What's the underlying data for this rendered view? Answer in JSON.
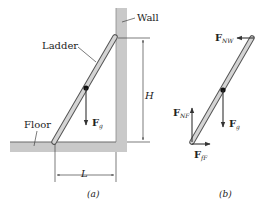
{
  "figure": {
    "panel_a": {
      "caption": "(a)",
      "labels": {
        "wall": "Wall",
        "ladder": "Ladder",
        "floor": "Floor",
        "height": "H",
        "length": "L",
        "weight_force": "F",
        "weight_sub": "g"
      }
    },
    "panel_b": {
      "caption": "(b)",
      "forces": {
        "normal_wall": {
          "symbol": "F",
          "sub": "NW"
        },
        "normal_floor": {
          "symbol": "F",
          "sub": "NF"
        },
        "friction_floor": {
          "symbol": "F",
          "sub": "fF"
        },
        "weight": {
          "symbol": "F",
          "sub": "g"
        }
      }
    },
    "colors": {
      "surface_gray": "#c9c9c9",
      "surface_edge": "#8a8a8a",
      "ladder_fill": "#cfcfcf",
      "ladder_edge": "#555555",
      "line": "#333333"
    }
  }
}
